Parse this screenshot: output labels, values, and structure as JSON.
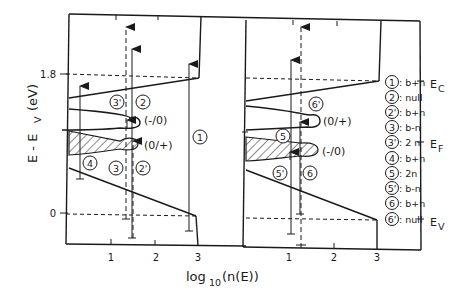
{
  "figure": {
    "y_axis_label": "E - E",
    "y_axis_sub": "V",
    "y_axis_unit": "(eV)",
    "x_axis_label_prefix": "log",
    "x_axis_label_sub": "10",
    "x_axis_label_suffix": "(n(E))",
    "y_ticks": [
      {
        "label": "1.8"
      },
      {
        "label": "0"
      }
    ],
    "left_panel": {
      "x_ticks": [
        "1",
        "2",
        "3"
      ],
      "state_labels": [
        "(-/0)",
        "(0/+)"
      ],
      "transition_labels": [
        "3'",
        "2",
        "1",
        "4",
        "3",
        "2'"
      ]
    },
    "right_panel": {
      "x_ticks": [
        "1",
        "2",
        "3"
      ],
      "state_labels": [
        "(0/+)",
        "(-/0)"
      ],
      "transition_labels": [
        "6'",
        "5",
        "5'",
        "6"
      ]
    },
    "level_labels": {
      "ec": "E",
      "ec_sub": "C",
      "ef": "E",
      "ef_sub": "F",
      "ev": "E",
      "ev_sub": "V"
    },
    "legend": [
      {
        "id": "1",
        "text": ": b+n"
      },
      {
        "id": "2",
        "text": ": null"
      },
      {
        "id": "2'",
        "text": ": b+n"
      },
      {
        "id": "3",
        "text": ": b-n"
      },
      {
        "id": "3'",
        "text": ": 2 n"
      },
      {
        "id": "4",
        "text": ": b+n"
      },
      {
        "id": "5",
        "text": ": 2n"
      },
      {
        "id": "5'",
        "text": ": b-n"
      },
      {
        "id": "6",
        "text": ": b+n"
      },
      {
        "id": "6'",
        "text": ": null"
      }
    ]
  }
}
